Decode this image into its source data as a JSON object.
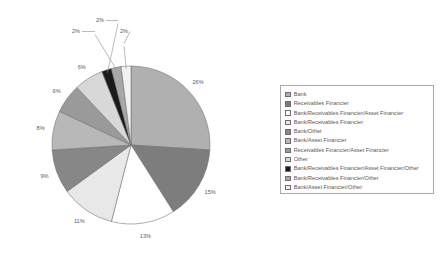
{
  "chart_data": {
    "type": "pie",
    "title": "",
    "categories": [
      "Bank",
      "Receivables Financier",
      "Bank/Receivables Financier/Asset Financier",
      "Bank/Receivables Financier",
      "Bank/Other",
      "Bank/Asset Financier",
      "Receivables Financier/Asset Financier",
      "Other",
      "Bank/Receivables Financier/Asset Financier/Other",
      "Bank/Receivables Financier/Other",
      "Bank/Asset Financier/Other"
    ],
    "values": [
      26,
      15,
      13,
      11,
      9,
      8,
      6,
      6,
      2,
      2,
      2
    ],
    "value_labels": [
      "26%",
      "15%",
      "13%",
      "11%",
      "9%",
      "8%",
      "6%",
      "6%",
      "2%",
      "2%",
      "2%"
    ],
    "colors": [
      "#b0b0b0",
      "#7d7d7d",
      "#ffffff",
      "#e8e8e8",
      "#878787",
      "#b8b8b8",
      "#9a9a9a",
      "#d8d8d8",
      "#1a1a1a",
      "#a8a8a8",
      "#f2f2f2"
    ],
    "start_angle_deg": 0,
    "direction": "clockwise",
    "grid": false,
    "legend_position": "right",
    "xlabel": "",
    "ylabel": ""
  },
  "legend": {
    "items": [
      {
        "label": "Bank",
        "swatch": "#b0b0b0"
      },
      {
        "label": "Receivables Financier",
        "swatch": "#7d7d7d"
      },
      {
        "label": "Bank/Receivables Financier/Asset Financier",
        "swatch": "#ffffff"
      },
      {
        "label": "Bank/Receivables Financier",
        "swatch": "#e8e8e8"
      },
      {
        "label": "Bank/Other",
        "swatch": "#878787"
      },
      {
        "label": "Bank/Asset Financier",
        "swatch": "#b8b8b8"
      },
      {
        "label": "Receivables Financier/Asset Financier",
        "swatch": "#9a9a9a"
      },
      {
        "label": "Other",
        "swatch": "#d8d8d8"
      },
      {
        "label": "Bank/Receivables Financier/Asset Financier/Other",
        "swatch": "#1a1a1a"
      },
      {
        "label": "Bank/Receivables Financier/Other",
        "swatch": "#a8a8a8"
      },
      {
        "label": "Bank/Asset Financier/Other",
        "swatch": "#f2f2f2"
      }
    ]
  }
}
